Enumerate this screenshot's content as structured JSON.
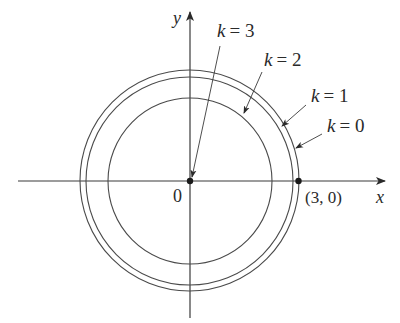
{
  "figure": {
    "axes": {
      "x_label": "x",
      "y_label": "y",
      "origin_label": "0"
    },
    "point_label": "(3, 0)",
    "curves": [
      {
        "k": "0",
        "label_k": "k",
        "label_eq": "= 0",
        "description": "outermost circle through (3,0)"
      },
      {
        "k": "1",
        "label_k": "k",
        "label_eq": "= 1",
        "description": "slightly smaller circle"
      },
      {
        "k": "2",
        "label_k": "k",
        "label_eq": "= 2",
        "description": "inner circle"
      },
      {
        "k": "3",
        "label_k": "k",
        "label_eq": "= 3",
        "description": "degenerates to the origin point"
      }
    ],
    "colors": {
      "stroke": "#3a3a3a",
      "text": "#2a2a2a"
    }
  }
}
